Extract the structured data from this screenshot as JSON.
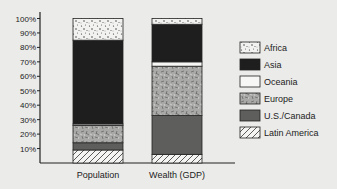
{
  "chart_data": {
    "type": "bar",
    "stacked": true,
    "title": "",
    "xlabel": "",
    "ylabel": "",
    "ylim": [
      0,
      100
    ],
    "y_ticks": [
      "10%",
      "20%",
      "30%",
      "40%",
      "50%",
      "60%",
      "70%",
      "80%",
      "90%",
      "100%"
    ],
    "categories": [
      "Population",
      "Wealth (GDP)"
    ],
    "series": [
      {
        "name": "Latin America",
        "pattern": "diagonal-hatch",
        "values": [
          9,
          6
        ]
      },
      {
        "name": "U.S./Canada",
        "pattern": "dark-gray",
        "values": [
          5,
          27
        ]
      },
      {
        "name": "Europe",
        "pattern": "gray-scribble",
        "values": [
          12,
          34
        ]
      },
      {
        "name": "Oceania",
        "pattern": "white",
        "values": [
          1,
          3
        ]
      },
      {
        "name": "Asia",
        "pattern": "black",
        "values": [
          58,
          26
        ]
      },
      {
        "name": "Africa",
        "pattern": "dotted",
        "values": [
          15,
          4
        ]
      }
    ],
    "legend": {
      "placement": "right",
      "entries": [
        "Africa",
        "Asia",
        "Oceania",
        "Europe",
        "U.S./Canada",
        "Latin America"
      ]
    },
    "grid": false
  }
}
